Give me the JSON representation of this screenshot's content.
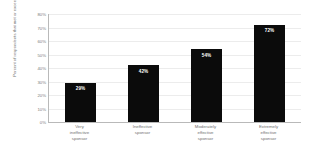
{
  "chart_data": {
    "type": "bar",
    "title": "",
    "xlabel": "",
    "ylabel": "Percent of respondents that met or exceeded objectives",
    "categories": [
      "Very\nineffective\nsponsor",
      "Ineffective\nsponsor",
      "Moderately\neffective\nsponsor",
      "Extremely\neffective\nsponsor"
    ],
    "values": [
      29,
      42,
      54,
      72
    ],
    "value_labels": [
      "29%",
      "42%",
      "54%",
      "72%"
    ],
    "ylim": [
      0,
      80
    ],
    "ytick_values": [
      0,
      10,
      20,
      30,
      40,
      50,
      60,
      70,
      80
    ],
    "ytick_labels": [
      "0%",
      "10%",
      "20%",
      "30%",
      "40%",
      "50%",
      "60%",
      "70%",
      "80%"
    ],
    "grid": true,
    "legend": false,
    "bar_color": "#0b0b0b",
    "value_label_color": "#ffffff",
    "gridline_color": "#ececec",
    "axis_color": "#b9b9b9",
    "tick_label_color": "#7a7a7a",
    "background_color": "#ffffff"
  }
}
